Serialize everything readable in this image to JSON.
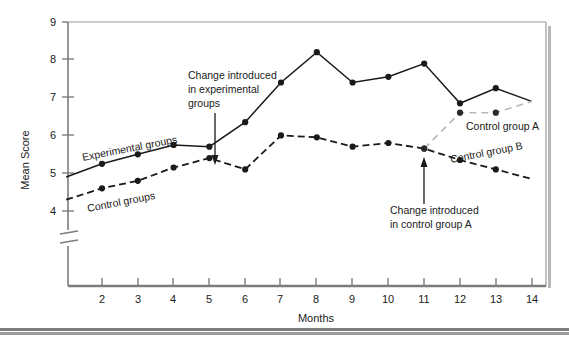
{
  "figure": {
    "background": "#ffffff",
    "frame_color": "#9a9a9a",
    "shadow_color": "#b0b0b0",
    "bottom_rule_color": "#7c7c7c"
  },
  "chart_data": {
    "type": "line",
    "title": "",
    "xlabel": "Months",
    "ylabel": "Mean Score",
    "x": [
      1,
      2,
      3,
      4,
      5,
      6,
      7,
      8,
      9,
      10,
      11,
      12,
      13,
      14
    ],
    "xtick_labels": [
      "2",
      "3",
      "4",
      "5",
      "6",
      "7",
      "8",
      "9",
      "10",
      "11",
      "12",
      "13",
      "14"
    ],
    "xticks": [
      2,
      3,
      4,
      5,
      6,
      7,
      8,
      9,
      10,
      11,
      12,
      13,
      14
    ],
    "xlim": [
      0.6,
      14.1
    ],
    "ytick_labels": [
      "4",
      "5",
      "6",
      "7",
      "8",
      "9"
    ],
    "yticks": [
      4,
      5,
      6,
      7,
      8,
      9
    ],
    "ylim": [
      4,
      9
    ],
    "y_axis_break": true,
    "y_axis_break_label": "axis-break",
    "grid": false,
    "legend_position": "inline-labels",
    "series": [
      {
        "name": "Experimental groups",
        "style": "solid",
        "color": "#1a1a1a",
        "marker": "filled-circle",
        "x": [
          1,
          2,
          3,
          4,
          5,
          6,
          7,
          8,
          9,
          10,
          11,
          12,
          13,
          14
        ],
        "values": [
          4.9,
          5.25,
          5.5,
          5.75,
          5.7,
          6.35,
          7.4,
          8.2,
          7.4,
          7.55,
          7.9,
          6.85,
          7.25,
          6.9
        ],
        "first_point_unmarked": true
      },
      {
        "name": "Control groups",
        "style": "dashed",
        "color": "#1a1a1a",
        "marker": "filled-circle",
        "x": [
          1,
          2,
          3,
          4,
          5,
          6,
          7,
          8,
          9,
          10,
          11,
          12,
          13,
          14
        ],
        "values": [
          4.3,
          4.6,
          4.8,
          5.15,
          5.4,
          5.1,
          6.0,
          5.95,
          5.7,
          5.8,
          5.65,
          5.35,
          5.1,
          4.85
        ],
        "first_point_unmarked": true,
        "label_note": "becomes Control group B after month 11"
      },
      {
        "name": "Control group A",
        "style": "dashed-light",
        "color": "#b8b8b8",
        "marker": "filled-circle",
        "x": [
          11,
          12,
          13,
          14
        ],
        "values": [
          5.65,
          6.6,
          6.6,
          6.9
        ],
        "branches_from": "Control groups at month 11"
      }
    ],
    "series_labels": [
      {
        "text": "Experimental groups",
        "x": 4.0,
        "y": 6.25,
        "rotation": -11
      },
      {
        "text": "Control groups",
        "x": 4.1,
        "y": 4.55,
        "rotation": -11
      },
      {
        "text": "Control group A",
        "x": 12.6,
        "y": 6.35,
        "rotation": 0
      },
      {
        "text": "Control group B",
        "x": 12.7,
        "y": 5.75,
        "rotation": -11
      }
    ],
    "annotations": [
      {
        "id": "annotation-experimental",
        "lines": [
          "Change introduced",
          "in experimental",
          "groups"
        ],
        "arrow_target_x": 5,
        "arrow_target_y": 5.9,
        "arrow_direction": "down"
      },
      {
        "id": "annotation-control-a",
        "lines": [
          "Change introduced",
          "in control group A"
        ],
        "arrow_target_x": 11,
        "arrow_target_y": 5.5,
        "arrow_direction": "up"
      }
    ]
  }
}
